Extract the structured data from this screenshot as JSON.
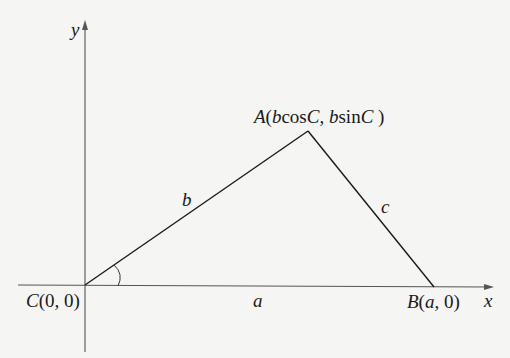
{
  "figure": {
    "type": "triangle-in-coordinate-plane",
    "axes": {
      "x_label": "x",
      "y_label": "y"
    },
    "points": {
      "A": {
        "name": "A",
        "coords_text": "(bcosC, bsinC)",
        "parts": [
          "A",
          "(",
          "b",
          "cos",
          "C",
          ", ",
          "b",
          "sin",
          "C",
          " )"
        ]
      },
      "B": {
        "name": "B",
        "coords_text": "(a, 0)",
        "parts": [
          "B",
          "(",
          "a",
          ", 0)"
        ]
      },
      "C": {
        "name": "C",
        "coords_text": "(0, 0)",
        "parts": [
          "C",
          "(0, 0)"
        ]
      }
    },
    "sides": {
      "a": "a",
      "b": "b",
      "c": "c"
    },
    "angle_marker": "C",
    "colors": {
      "background": "#f5f5f3",
      "axis": "#555555",
      "triangle": "#1a1a1a",
      "text": "#1a1a1a"
    }
  }
}
